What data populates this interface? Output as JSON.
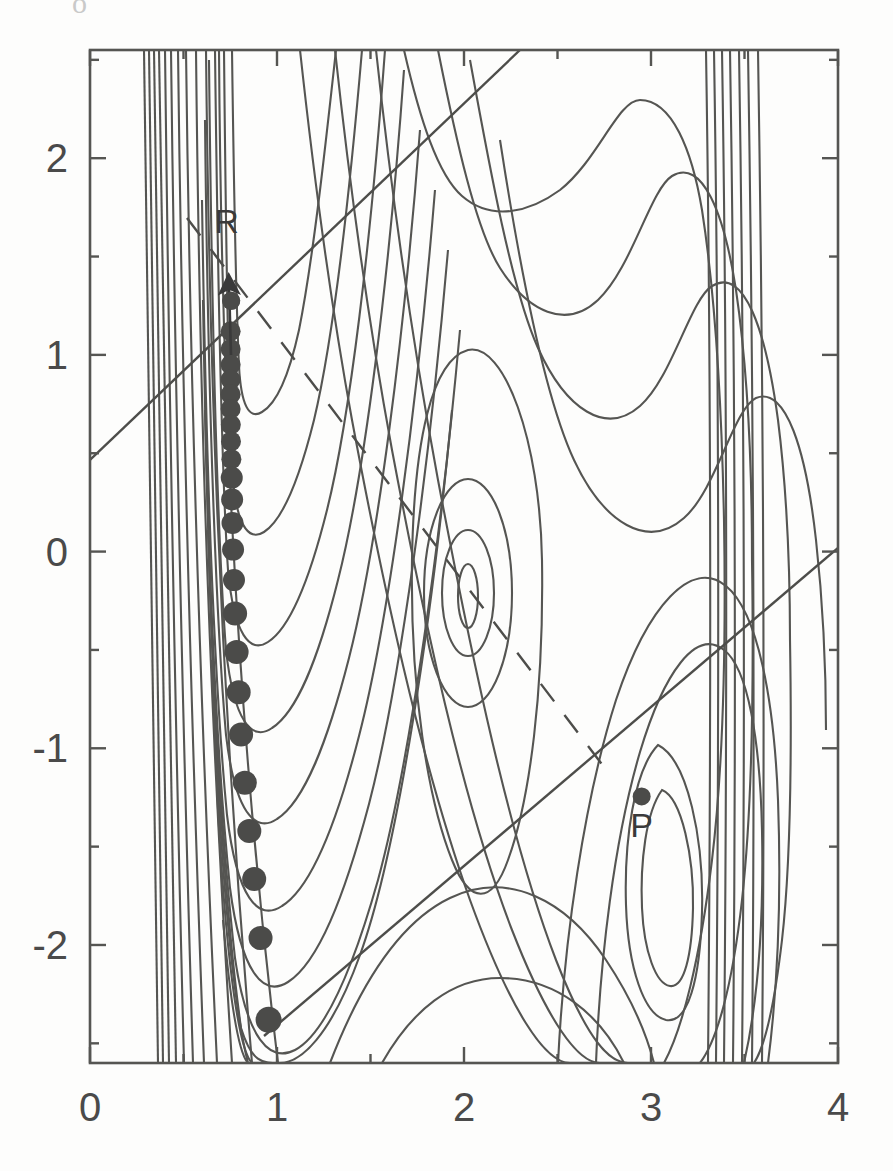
{
  "figure": {
    "background_color": "#fdfdfc",
    "ink_color": "#4a4a4a",
    "width": 893,
    "height": 1171,
    "stray_top_glyph": "o"
  },
  "axes": {
    "frame": {
      "left": 90,
      "top": 50,
      "right": 838,
      "bottom": 1063
    },
    "x": {
      "label": "",
      "min": 0,
      "max": 4,
      "major_ticks": [
        0,
        1,
        2,
        3,
        4
      ],
      "major_tick_labels": [
        "0",
        "1",
        "2",
        "3",
        "4"
      ],
      "minor_ticks": [
        0.5,
        1.5,
        2.5,
        3.5
      ]
    },
    "y": {
      "label": "",
      "min": -2.6,
      "max": 2.55,
      "major_ticks": [
        -2,
        -1,
        0,
        1,
        2
      ],
      "major_tick_labels": [
        "-2",
        "-1",
        "0",
        "1",
        "2"
      ],
      "minor_ticks": [
        -2.5,
        -1.5,
        -0.5,
        0.5,
        1.5,
        2.5
      ]
    }
  },
  "chart_data": {
    "type": "line",
    "title": "",
    "subtitle": "",
    "xlabel": "",
    "ylabel": "",
    "xlim": [
      0,
      4
    ],
    "ylim": [
      -2.6,
      2.55
    ],
    "grid": false,
    "legend": null,
    "annotations": [
      {
        "name": "R",
        "label": "R",
        "label_x": 0.73,
        "label_y": 1.62,
        "marker_x": 0.755,
        "marker_y": 1.275,
        "arrow_from_x": 0.76,
        "arrow_from_y": 1.1,
        "arrow_to_x": 0.755,
        "arrow_to_y": 1.45
      },
      {
        "name": "P",
        "label": "P",
        "label_x": 2.95,
        "label_y": -1.45,
        "marker_x": 2.95,
        "marker_y": -1.245
      }
    ],
    "trajectory": {
      "name": "trajectory-dots",
      "marker": "filled-circle",
      "points": [
        {
          "x": 0.755,
          "y": 1.275,
          "r": 9
        },
        {
          "x": 0.752,
          "y": 1.12,
          "r": 10
        },
        {
          "x": 0.752,
          "y": 1.03,
          "r": 10
        },
        {
          "x": 0.752,
          "y": 0.95,
          "r": 10
        },
        {
          "x": 0.752,
          "y": 0.875,
          "r": 10
        },
        {
          "x": 0.752,
          "y": 0.8,
          "r": 10
        },
        {
          "x": 0.752,
          "y": 0.725,
          "r": 10
        },
        {
          "x": 0.753,
          "y": 0.645,
          "r": 10
        },
        {
          "x": 0.754,
          "y": 0.56,
          "r": 10
        },
        {
          "x": 0.756,
          "y": 0.47,
          "r": 10
        },
        {
          "x": 0.758,
          "y": 0.375,
          "r": 11
        },
        {
          "x": 0.76,
          "y": 0.265,
          "r": 11
        },
        {
          "x": 0.762,
          "y": 0.145,
          "r": 11
        },
        {
          "x": 0.765,
          "y": 0.01,
          "r": 11
        },
        {
          "x": 0.77,
          "y": -0.145,
          "r": 11
        },
        {
          "x": 0.776,
          "y": -0.315,
          "r": 12
        },
        {
          "x": 0.784,
          "y": -0.51,
          "r": 12
        },
        {
          "x": 0.795,
          "y": -0.715,
          "r": 12
        },
        {
          "x": 0.808,
          "y": -0.93,
          "r": 12
        },
        {
          "x": 0.828,
          "y": -1.175,
          "r": 12
        },
        {
          "x": 0.852,
          "y": -1.42,
          "r": 12
        },
        {
          "x": 0.878,
          "y": -1.665,
          "r": 12
        },
        {
          "x": 0.912,
          "y": -1.965,
          "r": 12
        },
        {
          "x": 0.955,
          "y": -2.38,
          "r": 13
        }
      ]
    },
    "straight_lines": [
      {
        "name": "upper-solid-line",
        "style": "solid",
        "x1": 0.0,
        "y1": 0.55,
        "x2": 2.3,
        "y2": 2.55
      },
      {
        "name": "lower-solid-line",
        "style": "solid",
        "x1": 0.93,
        "y1": -2.42,
        "x2": 4.0,
        "y2": 0.06
      },
      {
        "name": "dashed-line",
        "style": "dashed",
        "x1": 0.52,
        "y1": 1.74,
        "x2": 2.75,
        "y2": -1.05
      }
    ],
    "contour_levels_description": "Roughly 20 nested contour levels; very densely packed vertical lines near x=0.30-0.55 (repulsive wall) and again near x=3.15-3.45 on the right.",
    "features": [
      {
        "name": "repulsive-wall-left",
        "x_range": [
          0.28,
          0.55
        ],
        "lines": 11
      },
      {
        "name": "reactant-valley",
        "x": 0.78,
        "y_range": [
          -2.5,
          2.5
        ]
      },
      {
        "name": "central-minimum",
        "x": 2.0,
        "y": -0.3
      },
      {
        "name": "product-well",
        "x": 2.95,
        "y": -1.25
      },
      {
        "name": "right-wall",
        "x_range": [
          3.15,
          3.45
        ],
        "lines": 7
      }
    ]
  }
}
